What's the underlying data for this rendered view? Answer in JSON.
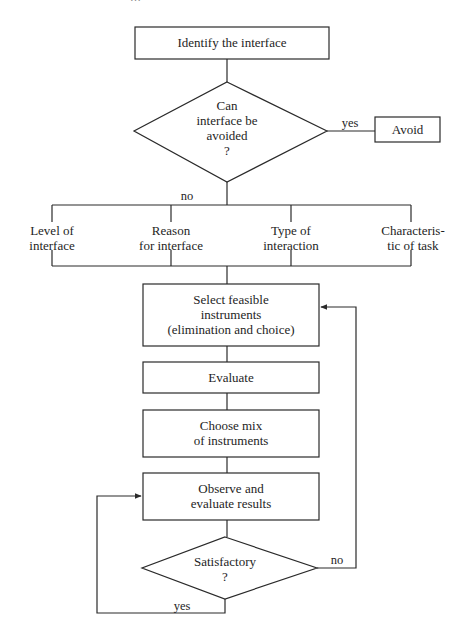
{
  "page": {
    "header_clipped": "…"
  },
  "flowchart": {
    "nodes": {
      "identify": "Identify the interface",
      "decision_avoid": {
        "line1": "Can",
        "line2": "interface be",
        "line3": "avoided",
        "line4": "?"
      },
      "avoid": "Avoid",
      "factors": [
        {
          "line1": "Level of",
          "line2": "interface"
        },
        {
          "line1": "Reason",
          "line2": "for interface"
        },
        {
          "line1": "Type of",
          "line2": "interaction"
        },
        {
          "line1": "Characteris-",
          "line2": "tic of task"
        }
      ],
      "select": {
        "line1": "Select feasible",
        "line2": "instruments",
        "line3": "(elimination and choice)"
      },
      "evaluate": "Evaluate",
      "choose": {
        "line1": "Choose mix",
        "line2": "of instruments"
      },
      "observe": {
        "line1": "Observe and",
        "line2": "evaluate results"
      },
      "decision_satisfactory": {
        "line1": "Satisfactory",
        "line2": "?"
      }
    },
    "edge_labels": {
      "avoid_yes": "yes",
      "avoid_no": "no",
      "satisfactory_no": "no",
      "satisfactory_yes": "yes"
    },
    "colors": {
      "stroke": "#2a2a2a",
      "background": "#ffffff"
    }
  }
}
